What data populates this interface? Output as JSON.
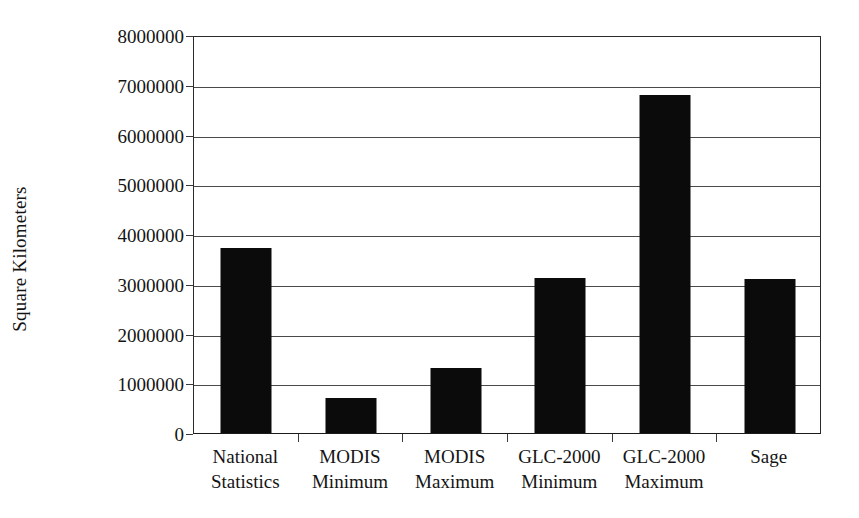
{
  "chart_data": {
    "type": "bar",
    "title": "",
    "xlabel": "",
    "ylabel": "Square Kilometers",
    "categories": [
      "National Statistics",
      "MODIS Minimum",
      "MODIS Maximum",
      "GLC-2000 Minimum",
      "GLC-2000 Maximum",
      "Sage"
    ],
    "category_lines": [
      [
        "National",
        "Statistics"
      ],
      [
        "MODIS",
        "Minimum"
      ],
      [
        "MODIS",
        "Maximum"
      ],
      [
        "GLC-2000",
        "Minimum"
      ],
      [
        "GLC-2000",
        "Maximum"
      ],
      [
        "Sage",
        ""
      ]
    ],
    "values": [
      3720000,
      700000,
      1300000,
      3110000,
      6800000,
      3100000
    ],
    "ylim": [
      0,
      8000000
    ],
    "ytick_values": [
      0,
      1000000,
      2000000,
      3000000,
      4000000,
      5000000,
      6000000,
      7000000,
      8000000
    ],
    "ytick_labels": [
      "0",
      "1000000",
      "2000000",
      "3000000",
      "4000000",
      "5000000",
      "6000000",
      "7000000",
      "8000000"
    ],
    "grid": true,
    "grid_axis": "y",
    "legend": false,
    "legend_position": "none",
    "bar_color": "#0b0b0b",
    "gridline_color": "#4a4a4a",
    "axis_color": "#1a1a1a",
    "background_color": "#ffffff"
  }
}
